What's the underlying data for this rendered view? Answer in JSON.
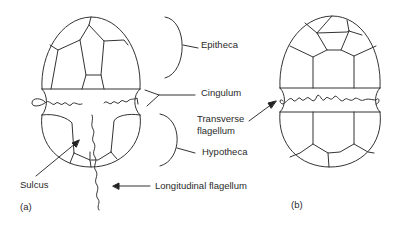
{
  "figure": {
    "panels": [
      {
        "id": "a",
        "label": "(a)",
        "view": "ventral"
      },
      {
        "id": "b",
        "label": "(b)",
        "view": "dorsal"
      }
    ],
    "labels": {
      "epitheca": "Epitheca",
      "cingulum": "Cingulum",
      "transverse_1": "Transverse",
      "transverse_2": "flagellum",
      "hypotheca": "Hypotheca",
      "sulcus": "Sulcus",
      "longitudinal": "Longitudinal flagellum",
      "panel_a": "(a)",
      "panel_b": "(b)"
    },
    "colors": {
      "line": "#333333",
      "text": "#2a2a2a",
      "background": "#ffffff"
    }
  }
}
